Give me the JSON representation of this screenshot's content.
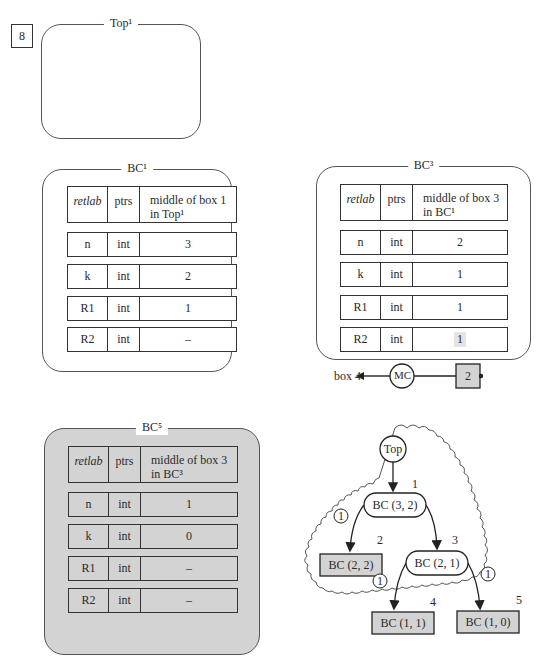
{
  "step_number": "8",
  "frames": {
    "top1": {
      "title": "Top¹"
    },
    "bc1": {
      "title": "BC¹",
      "header": {
        "retlab": "retlab",
        "ptrs": "ptrs",
        "value_line1": "middle of box 1",
        "value_line2": "in Top¹"
      },
      "rows": [
        {
          "name": "n",
          "type": "int",
          "value": "3"
        },
        {
          "name": "k",
          "type": "int",
          "value": "2"
        },
        {
          "name": "R1",
          "type": "int",
          "value": "1"
        },
        {
          "name": "R2",
          "type": "int",
          "value": "–"
        }
      ]
    },
    "bc3": {
      "title": "BC³",
      "header": {
        "retlab": "retlab",
        "ptrs": "ptrs",
        "value_line1": "middle of box 3",
        "value_line2": "in BC¹"
      },
      "rows": [
        {
          "name": "n",
          "type": "int",
          "value": "2"
        },
        {
          "name": "k",
          "type": "int",
          "value": "1"
        },
        {
          "name": "R1",
          "type": "int",
          "value": "1"
        },
        {
          "name": "R2",
          "type": "int",
          "value": "1"
        }
      ],
      "call_line": {
        "target_label": "box 4",
        "node_label": "MC",
        "counter": "2"
      }
    },
    "bc5": {
      "title": "BC⁵",
      "header": {
        "retlab": "retlab",
        "ptrs": "ptrs",
        "value_line1": "middle of box 3",
        "value_line2": "in BC³"
      },
      "rows": [
        {
          "name": "n",
          "type": "int",
          "value": "1"
        },
        {
          "name": "k",
          "type": "int",
          "value": "0"
        },
        {
          "name": "R1",
          "type": "int",
          "value": "–"
        },
        {
          "name": "R2",
          "type": "int",
          "value": "–"
        }
      ]
    }
  },
  "call_tree": {
    "root": "Top",
    "nodes": [
      {
        "id": "1",
        "label": "BC (3, 2)",
        "shape": "pill",
        "shaded": false
      },
      {
        "id": "2",
        "label": "BC (2, 2)",
        "shape": "rect",
        "shaded": true
      },
      {
        "id": "3",
        "label": "BC (2, 1)",
        "shape": "pill",
        "shaded": false
      },
      {
        "id": "4",
        "label": "BC (1, 1)",
        "shape": "rect",
        "shaded": true
      },
      {
        "id": "5",
        "label": "BC (1, 0)",
        "shape": "rect",
        "shaded": true
      }
    ],
    "edge_labels": [
      "1",
      "1",
      "1"
    ]
  }
}
